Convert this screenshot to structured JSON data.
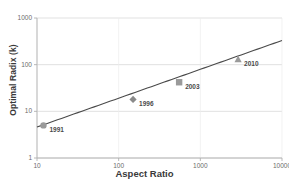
{
  "chart_data": {
    "type": "line",
    "title": "",
    "xlabel": "Aspect Ratio",
    "ylabel": "Optimal Radix (k)",
    "xscale": "log",
    "yscale": "log",
    "xlim": [
      10,
      10000
    ],
    "ylim": [
      1,
      1000
    ],
    "grid": true,
    "legend": "none",
    "xticks": [
      "10",
      "100",
      "1000",
      "10000"
    ],
    "xtick_values": [
      10,
      100,
      1000,
      10000
    ],
    "yticks": [
      "1",
      "10",
      "100",
      "1000"
    ],
    "ytick_values": [
      1,
      10,
      100,
      1000
    ],
    "series": [
      {
        "name": "Optimal Radix trend",
        "color": "#4a4a4a",
        "x": [
          10,
          10000
        ],
        "y": [
          4.6,
          330
        ]
      }
    ],
    "points": [
      {
        "label": "1991",
        "x": 12,
        "y": 5.0,
        "marker": "circle",
        "color": "#9a9a9a"
      },
      {
        "label": "1996",
        "x": 150,
        "y": 18,
        "marker": "diamond",
        "color": "#8a8a8a"
      },
      {
        "label": "2003",
        "x": 550,
        "y": 42,
        "marker": "square",
        "color": "#9a9a9a"
      },
      {
        "label": "2010",
        "x": 2900,
        "y": 130,
        "marker": "triangle",
        "color": "#9a9a9a"
      }
    ],
    "colors": {
      "line": "#4a4a4a",
      "grid": "#d9d9d9",
      "axis": "#b0b0b0",
      "text": "#5a5a5a",
      "background": "#ffffff"
    }
  }
}
